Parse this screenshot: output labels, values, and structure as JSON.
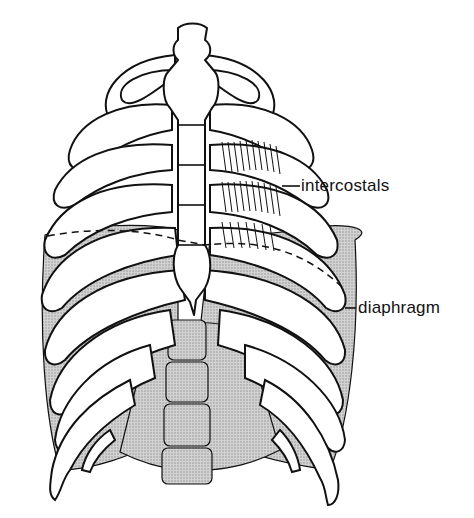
{
  "figure": {
    "labels": [
      {
        "id": "intercostals",
        "text": "intercostals"
      },
      {
        "id": "diaphragm",
        "text": "diaphragm"
      }
    ],
    "colors": {
      "line": "#111111",
      "background": "#ffffff",
      "stipple": "#bdbdbd"
    }
  }
}
